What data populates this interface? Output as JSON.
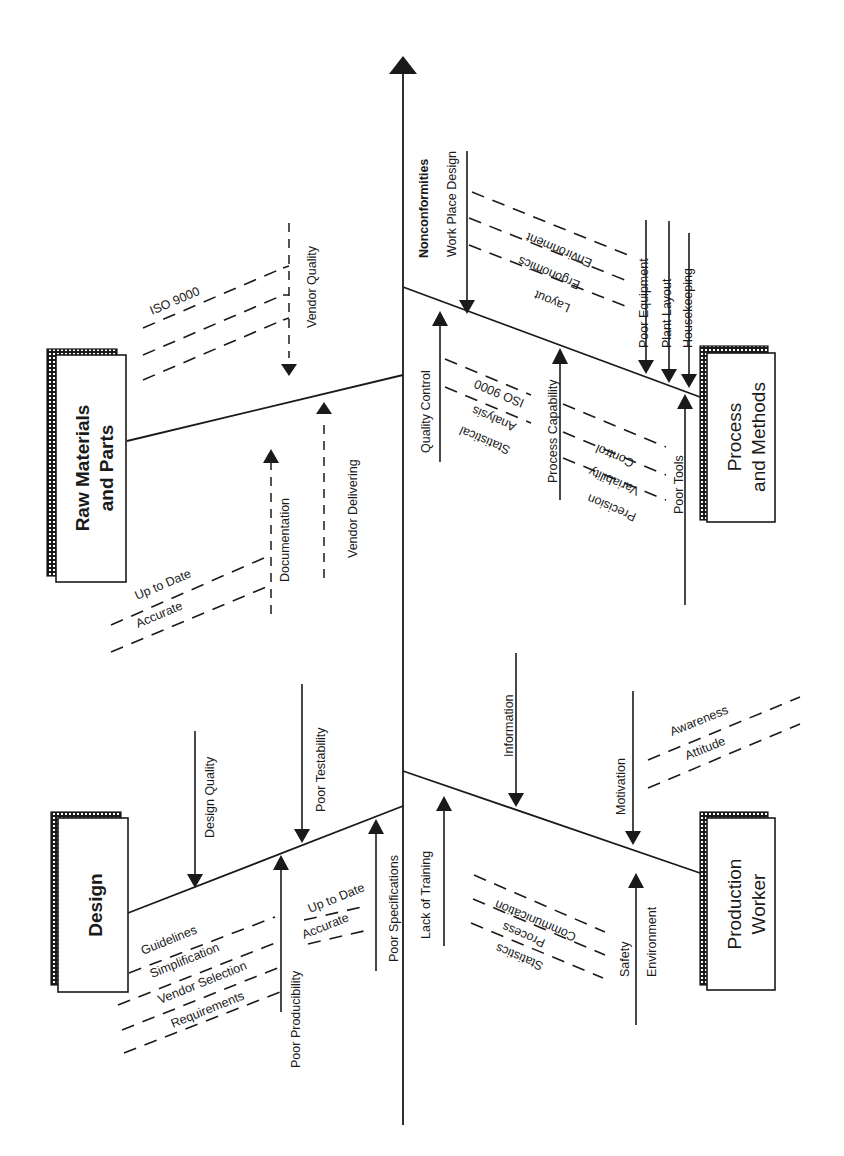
{
  "diagram": {
    "type": "cause-and-effect (fishbone / Ishikawa) diagram, rotated 90 degrees",
    "effect": "Nonconformities",
    "categories": {
      "raw_materials": {
        "title_line1": "Raw Materials",
        "title_line2": "and Parts",
        "causes": {
          "vendor_quality": "Vendor Quality",
          "iso9000": "ISO 9000",
          "documentation": "Documentation",
          "up_to_date": "Up to Date",
          "accurate": "Accurate",
          "vendor_delivering": "Vendor Delivering"
        }
      },
      "process_methods": {
        "title_line1": "Process",
        "title_line2": "and Methods",
        "causes": {
          "work_place_design": "Work Place Design",
          "environment": "Environment",
          "ergonomics": "Ergonomics",
          "layout": "Layout",
          "poor_equipment": "Poor Equipment",
          "plant_layout": "Plant Layout",
          "housekeeping": "Housekeeping",
          "quality_control": "Quality Control",
          "iso9000": "ISO 9000",
          "analysis": "Analysis",
          "statistical": "Statistical",
          "process_capability": "Process Capability",
          "control": "Control",
          "variability": "Variability",
          "precision": "Precision",
          "poor_tools": "Poor Tools"
        }
      },
      "design": {
        "title": "Design",
        "causes": {
          "design_quality": "Design Quality",
          "poor_testability": "Poor Testability",
          "guidelines": "Guidelines",
          "simplification": "Simplification",
          "vendor_selection": "Vendor Selection",
          "requirements": "Requirements",
          "poor_producibility": "Poor Producibility",
          "up_to_date": "Up to Date",
          "accurate": "Accurate",
          "poor_specifications": "Poor Specifications"
        }
      },
      "production_worker": {
        "title_line1": "Production",
        "title_line2": "Worker",
        "causes": {
          "information": "Information",
          "motivation": "Motivation",
          "awareness": "Awareness",
          "attitude": "Attitude",
          "lack_of_training": "Lack of Training",
          "communication": "Communication",
          "process": "Process",
          "statistics": "Statistics",
          "safety": "Safety",
          "environment": "Environment"
        }
      }
    }
  }
}
